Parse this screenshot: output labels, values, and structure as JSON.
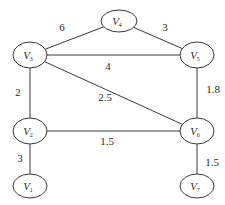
{
  "diagram": {
    "type": "weighted-undirected-graph",
    "nodes": [
      {
        "id": "V1",
        "letter": "V",
        "sub": "1",
        "cx": 30,
        "cy": 186,
        "rx": 17,
        "ry": 12
      },
      {
        "id": "V2",
        "letter": "V",
        "sub": "2",
        "cx": 30,
        "cy": 131,
        "rx": 17,
        "ry": 13
      },
      {
        "id": "V3",
        "letter": "V",
        "sub": "3",
        "cx": 30,
        "cy": 55,
        "rx": 17,
        "ry": 13
      },
      {
        "id": "V4",
        "letter": "V",
        "sub": "4",
        "cx": 119,
        "cy": 21,
        "rx": 18,
        "ry": 11
      },
      {
        "id": "V5",
        "letter": "V",
        "sub": "5",
        "cx": 197,
        "cy": 55,
        "rx": 17,
        "ry": 13
      },
      {
        "id": "V6",
        "letter": "V",
        "sub": "6",
        "cx": 197,
        "cy": 131,
        "rx": 17,
        "ry": 13
      },
      {
        "id": "V7",
        "letter": "V",
        "sub": "7",
        "cx": 197,
        "cy": 186,
        "rx": 17,
        "ry": 12
      }
    ],
    "edges": [
      {
        "from": "V3",
        "to": "V4",
        "weight": "6",
        "label_x": 62,
        "label_y": 28
      },
      {
        "from": "V4",
        "to": "V5",
        "weight": "3",
        "label_x": 165,
        "label_y": 28
      },
      {
        "from": "V3",
        "to": "V5",
        "weight": "4",
        "label_x": 108,
        "label_y": 67
      },
      {
        "from": "V3",
        "to": "V2",
        "weight": "2",
        "label_x": 18,
        "label_y": 93
      },
      {
        "from": "V3",
        "to": "V6",
        "weight": "2.5",
        "label_x": 105,
        "label_y": 98
      },
      {
        "from": "V5",
        "to": "V6",
        "weight": "1.8",
        "label_x": 213,
        "label_y": 90
      },
      {
        "from": "V2",
        "to": "V6",
        "weight": "1.5",
        "label_x": 107,
        "label_y": 142
      },
      {
        "from": "V2",
        "to": "V1",
        "weight": "3",
        "label_x": 20,
        "label_y": 159
      },
      {
        "from": "V6",
        "to": "V7",
        "weight": "1.5",
        "label_x": 212,
        "label_y": 163
      }
    ]
  }
}
